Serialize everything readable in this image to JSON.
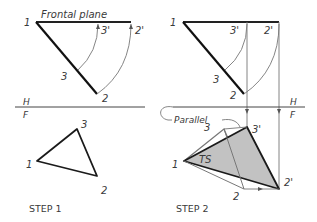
{
  "step1": {
    "title": "STEP 1",
    "plane_label": "Frontal plane",
    "points_top": {
      "p1": "1",
      "p2": "2",
      "p3": "3",
      "p2p": "2'",
      "p3p": "3'"
    },
    "points_bottom": {
      "p1": "1",
      "p2": "2",
      "p3": "3"
    },
    "fold_top": "H",
    "fold_bottom": "F"
  },
  "step2": {
    "title": "STEP 2",
    "points_top": {
      "p1": "1",
      "p2": "2",
      "p3": "3",
      "p2p": "2'",
      "p3p": "3'"
    },
    "points_bottom": {
      "p1": "1",
      "p2": "2",
      "p3": "3",
      "p2p": "2'",
      "p3p": "3'"
    },
    "fold_top": "H",
    "fold_bottom": "F",
    "parallel_label": "Parallel",
    "true_shape_label": "TS"
  },
  "colors": {
    "line_dark": "#1a1a1a",
    "line_light": "#777777",
    "fill_ts": "#c2c2c2"
  }
}
